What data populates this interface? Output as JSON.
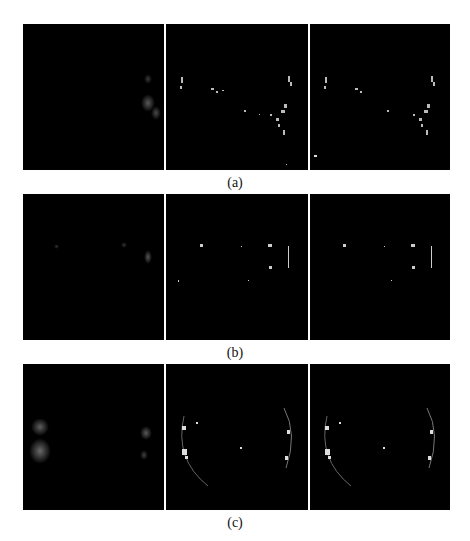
{
  "figure": {
    "rows": [
      {
        "label": "(a)",
        "panels": [
          {
            "name": "input",
            "description": "faint blurred blob right side"
          },
          {
            "name": "result-1",
            "description": "sparse bright speckles along arcs"
          },
          {
            "name": "result-2",
            "description": "sparse bright speckles along arcs"
          }
        ]
      },
      {
        "label": "(b)",
        "panels": [
          {
            "name": "input",
            "description": "very faint dots"
          },
          {
            "name": "result-1",
            "description": "few bright points and right arc"
          },
          {
            "name": "result-2",
            "description": "few bright points and right arc"
          }
        ]
      },
      {
        "label": "(c)",
        "panels": [
          {
            "name": "input",
            "description": "blurred blobs left and right"
          },
          {
            "name": "result-1",
            "description": "bright ring arcs left and right"
          },
          {
            "name": "result-2",
            "description": "bright ring arcs left and right"
          }
        ]
      }
    ]
  }
}
